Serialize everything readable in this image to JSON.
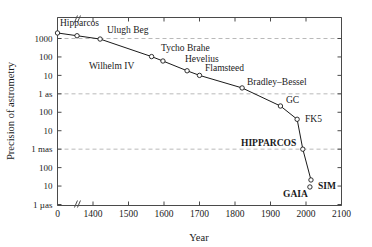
{
  "chart_data": {
    "type": "line",
    "title": "",
    "xlabel": "Year",
    "ylabel": "Precision of astrometry",
    "xlim": [
      1300,
      2100
    ],
    "axis_break_x": true,
    "grid": "horizontal dashed at 1000 arcsec, 1 as, 1 mas",
    "legend": "none",
    "xticks": [
      {
        "label": "0",
        "value": 1300
      },
      {
        "label": "1400",
        "value": 1400
      },
      {
        "label": "1500",
        "value": 1500
      },
      {
        "label": "1600",
        "value": 1600
      },
      {
        "label": "1700",
        "value": 1700
      },
      {
        "label": "1800",
        "value": 1800
      },
      {
        "label": "1900",
        "value": 1900
      },
      {
        "label": "2000",
        "value": 2000
      },
      {
        "label": "2100",
        "value": 2100
      }
    ],
    "yticks": [
      {
        "label": "1000",
        "decade": 3
      },
      {
        "label": "100",
        "decade": 2
      },
      {
        "label": "10",
        "decade": 1
      },
      {
        "label": "1 as",
        "decade": 0
      },
      {
        "label": "100",
        "decade": -1
      },
      {
        "label": "10",
        "decade": -2
      },
      {
        "label": "1 mas",
        "decade": -3
      },
      {
        "label": "100",
        "decade": -4
      },
      {
        "label": "10",
        "decade": -5
      },
      {
        "label": "1 µas",
        "decade": -6
      }
    ],
    "points": [
      {
        "name": "Hipparcos",
        "x": 1300,
        "y_decade": 3.3,
        "label": "Hipparcos",
        "lx": 60,
        "ly": 26,
        "bold": false
      },
      {
        "name": "Hipparcos2",
        "x": 1355,
        "y_decade": 3.15,
        "label": "",
        "lx": 0,
        "ly": 0,
        "bold": false
      },
      {
        "name": "Ulugh Beg",
        "x": 1420,
        "y_decade": 2.97,
        "label": "Ulugh Beg",
        "lx": 107,
        "ly": 33,
        "bold": false
      },
      {
        "name": "Wilhelm IV",
        "x": 1565,
        "y_decade": 2.02,
        "label": "Wilhelm IV",
        "lx": 89,
        "ly": 69,
        "bold": false
      },
      {
        "name": "Tycho Brahe",
        "x": 1597,
        "y_decade": 1.78,
        "label": "Tycho Brahe",
        "lx": 161,
        "ly": 51,
        "bold": false
      },
      {
        "name": "Hevelius",
        "x": 1665,
        "y_decade": 1.25,
        "label": "Hevelius",
        "lx": 185,
        "ly": 62,
        "bold": false
      },
      {
        "name": "Flamsteed",
        "x": 1700,
        "y_decade": 1.0,
        "label": "Flamsteed",
        "lx": 205,
        "ly": 71,
        "bold": false
      },
      {
        "name": "Bradley-Bessel",
        "x": 1820,
        "y_decade": 0.32,
        "label": "Bradley–Bessel",
        "lx": 247,
        "ly": 85,
        "bold": false
      },
      {
        "name": "GC",
        "x": 1928,
        "y_decade": -0.66,
        "label": "GC",
        "lx": 286,
        "ly": 103,
        "bold": false
      },
      {
        "name": "FK5",
        "x": 1975,
        "y_decade": -1.38,
        "label": "FK5",
        "lx": 305,
        "ly": 122,
        "bold": false
      },
      {
        "name": "HIPPARCOS",
        "x": 1991,
        "y_decade": -3.0,
        "label": "HIPPARCOS",
        "lx": 241,
        "ly": 146,
        "bold": true
      },
      {
        "name": "GAIA",
        "x": 2011,
        "y_decade": -5.05,
        "label": "GAIA",
        "lx": 283,
        "ly": 197,
        "bold": true
      },
      {
        "name": "SIM",
        "x": 2014,
        "y_decade": -4.67,
        "label": "SIM",
        "lx": 318,
        "ly": 189,
        "bold": true
      }
    ]
  },
  "colors": {
    "axis": "#4a4a4a",
    "grid": "#b9b9b9",
    "line": "#1a1a1a",
    "background": "#ffffff"
  }
}
